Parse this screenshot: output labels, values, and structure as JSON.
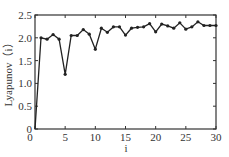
{
  "chart_data": {
    "type": "line",
    "title": "",
    "xlabel": "i",
    "ylabel": "Lyapunov（i）",
    "xlim": [
      0,
      30
    ],
    "ylim": [
      0,
      2.5
    ],
    "xticks": [
      0,
      5,
      10,
      15,
      20,
      25,
      30
    ],
    "yticks": [
      0,
      0.5,
      1.0,
      1.5,
      2.0,
      2.5
    ],
    "xtick_labels": [
      "0",
      "5",
      "10",
      "15",
      "20",
      "25",
      "30"
    ],
    "ytick_labels": [
      "0",
      "0.5",
      "1.0",
      "1.5",
      "2.0",
      "2.5"
    ],
    "grid": false,
    "legend": null,
    "series": [
      {
        "name": "Lyapunov",
        "marker": "circle",
        "color": "#222222",
        "x": [
          0,
          1,
          2,
          3,
          4,
          5,
          6,
          7,
          8,
          9,
          10,
          11,
          12,
          13,
          14,
          15,
          16,
          17,
          18,
          19,
          20,
          21,
          22,
          23,
          24,
          25,
          26,
          27,
          28,
          29,
          30
        ],
        "values": [
          0,
          2.0,
          1.97,
          2.07,
          1.97,
          1.2,
          2.05,
          2.05,
          2.18,
          2.08,
          1.75,
          2.21,
          2.12,
          2.24,
          2.24,
          2.06,
          2.21,
          2.23,
          2.24,
          2.31,
          2.13,
          2.3,
          2.26,
          2.21,
          2.33,
          2.19,
          2.24,
          2.35,
          2.27,
          2.27,
          2.27
        ]
      }
    ]
  },
  "colors": {
    "line": "#222222",
    "axis": "#333333",
    "background": "#ffffff"
  }
}
